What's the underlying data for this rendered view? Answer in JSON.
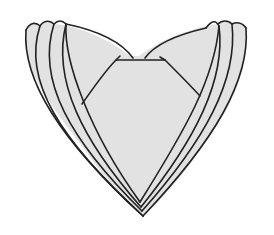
{
  "illustration": {
    "subject": "folded napkin heart shape",
    "layers": 4,
    "colors": {
      "background": "#ffffff",
      "fill": "#e2e2e2",
      "outline": "#222222"
    }
  }
}
